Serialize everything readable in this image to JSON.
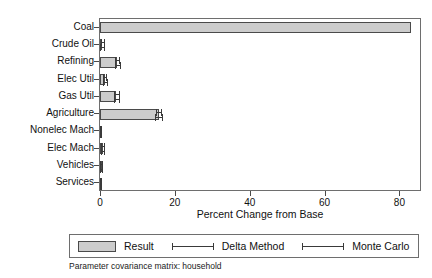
{
  "chart_data": {
    "type": "bar",
    "orientation": "horizontal",
    "title": "",
    "xlabel": "Percent Change from Base",
    "ylabel": "",
    "xlim": [
      0,
      85.5
    ],
    "xticks": [
      0,
      20,
      40,
      60,
      80
    ],
    "xtick_labels": [
      "0",
      "20",
      "40",
      "60",
      "80"
    ],
    "grid": false,
    "categories": [
      "Coal",
      "Crude Oil",
      "Refining",
      "Elec Util",
      "Gas Util",
      "Agriculture",
      "Nonelec Mach",
      "Elec Mach",
      "Vehicles",
      "Services"
    ],
    "series": [
      {
        "name": "Result",
        "values": [
          83.0,
          0.6,
          4.6,
          1.3,
          4.4,
          15.7,
          0.1,
          0.7,
          0.2,
          0.1
        ]
      }
    ],
    "error_bars": [
      {
        "name": "Delta Method",
        "lower": [
          83.0,
          0.2,
          4.0,
          0.9,
          3.8,
          15.0,
          0.0,
          0.3,
          0.0,
          0.0
        ],
        "upper": [
          83.0,
          1.0,
          5.2,
          1.7,
          5.0,
          16.4,
          0.3,
          1.1,
          0.5,
          0.3
        ]
      },
      {
        "name": "Monte Carlo",
        "lower": [
          83.0,
          0.1,
          3.9,
          0.8,
          3.7,
          14.8,
          0.0,
          0.2,
          0.0,
          0.0
        ],
        "upper": [
          83.0,
          1.1,
          5.3,
          1.8,
          5.1,
          16.6,
          0.4,
          1.2,
          0.6,
          0.4
        ]
      }
    ],
    "legend": {
      "position": "below",
      "entries": [
        {
          "label": "Result",
          "marker": "filled-box",
          "color": "#cccccc"
        },
        {
          "label": "Delta Method",
          "marker": "error-bar",
          "color": "#3a3a3a"
        },
        {
          "label": "Monte Carlo",
          "marker": "error-bar",
          "color": "#3a3a3a"
        }
      ]
    },
    "caption": "Parameter covariance matrix: household",
    "colors": {
      "bar_fill": "#cccccc",
      "bar_edge": "#4a4a4a",
      "axis": "#6e6e6e",
      "text": "#111111"
    }
  }
}
